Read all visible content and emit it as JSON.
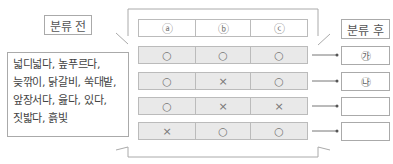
{
  "before_label": "분류 전",
  "after_label": "분류 후",
  "words": [
    "넓디넓다,  높푸르다,",
    "늦깎이, 닭갈비, 쑥대밭,",
    "앞장서다,  읊다,  있다,",
    "짓밟다, 흙빛"
  ],
  "table": {
    "headers": [
      "ⓐ",
      "ⓑ",
      "ⓒ"
    ],
    "rows": [
      [
        "○",
        "○",
        "○"
      ],
      [
        "○",
        "×",
        "○"
      ],
      [
        "○",
        "×",
        "×"
      ],
      [
        "×",
        "○",
        "○"
      ]
    ]
  },
  "results": [
    "㉮",
    "㉯",
    "",
    ""
  ]
}
